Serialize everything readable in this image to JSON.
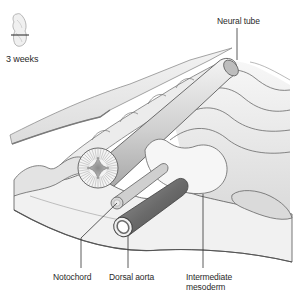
{
  "figure": {
    "stage_label": "3 weeks",
    "labels": {
      "neural_tube": "Neural tube",
      "notochord": "Notochord",
      "dorsal_aorta": "Dorsal aorta",
      "intermediate_mesoderm_line1": "Intermediate",
      "intermediate_mesoderm_line2": "mesoderm"
    }
  },
  "colors": {
    "outline": "#555555",
    "fill_light": "#f2f2f2",
    "fill_mid": "#d9d9d9",
    "fill_dark": "#9a9a9a",
    "aorta_dark": "#6e6e6e",
    "leader_line": "#333333"
  }
}
